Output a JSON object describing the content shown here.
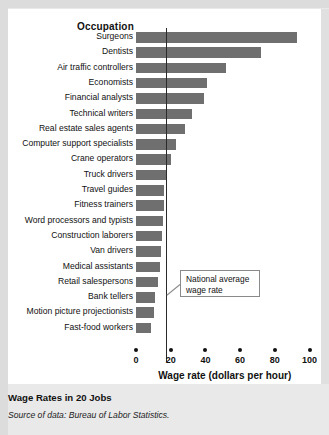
{
  "figure": {
    "title": "Wage Rates in 20 Jobs",
    "source": "Source of data: Bureau of Labor Statistics.",
    "column_header": "Occupation",
    "callout": "National average wage rate",
    "accent_bar_color": "#6f6f6f",
    "reference_line_color": "#2a2a2a",
    "panel_color": "#ffffff",
    "background_color": "#e9e9e9"
  },
  "chart_data": {
    "type": "bar",
    "orientation": "horizontal",
    "title": "Wage Rates in 20 Jobs",
    "xlabel": "Wage rate (dollars per hour)",
    "ylabel": "Occupation",
    "xlim": [
      0,
      104
    ],
    "xticks": [
      0,
      20,
      40,
      60,
      80,
      100
    ],
    "xticklabels": [
      "0",
      "20",
      "40",
      "60",
      "80",
      "100"
    ],
    "grid": false,
    "legend": "none",
    "reference_line": {
      "label": "National average wage rate",
      "value": 17.6
    },
    "categories": [
      "Surgeons",
      "Dentists",
      "Air traffic controllers",
      "Economists",
      "Financial analysts",
      "Technical writers",
      "Real estate sales agents",
      "Computer support specialists",
      "Crane operators",
      "Truck drivers",
      "Travel guides",
      "Fitness trainers",
      "Word processors and typists",
      "Construction laborers",
      "Van drivers",
      "Medical assistants",
      "Retail salespersons",
      "Bank tellers",
      "Motion picture projectionists",
      "Fast-food workers"
    ],
    "values": [
      93,
      72,
      52,
      41,
      39,
      32,
      28,
      23,
      20,
      18,
      16,
      16,
      15.5,
      15,
      14.5,
      14,
      12.5,
      11,
      10.5,
      8.7
    ]
  }
}
